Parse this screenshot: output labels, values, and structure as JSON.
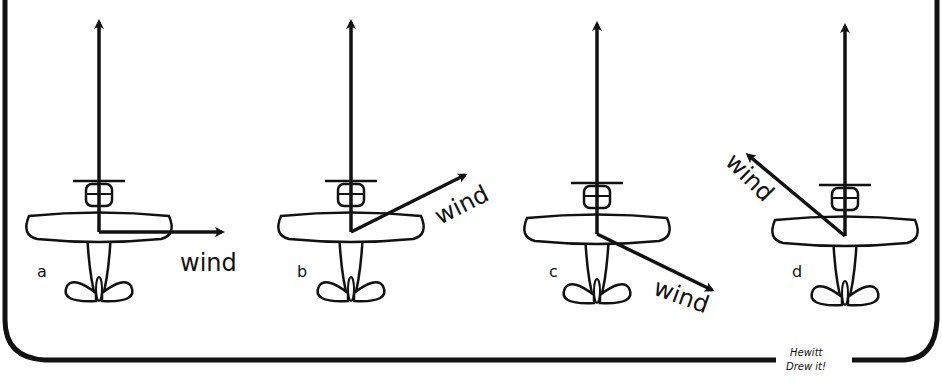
{
  "diagram": {
    "panels": [
      {
        "id": "a",
        "label": "a",
        "wind_label": "wind"
      },
      {
        "id": "b",
        "label": "b",
        "wind_label": "wind"
      },
      {
        "id": "c",
        "label": "c",
        "wind_label": "wind"
      },
      {
        "id": "d",
        "label": "d",
        "wind_label": "wind"
      }
    ],
    "signature": {
      "line1": "Hewitt",
      "line2": "Drew it!"
    }
  }
}
